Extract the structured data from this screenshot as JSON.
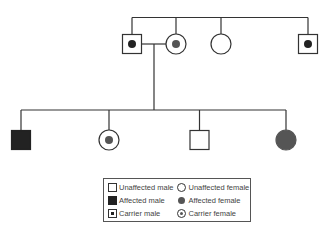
{
  "diagram": {
    "type": "pedigree",
    "colors": {
      "line": "#333333",
      "affected_male": "#222222",
      "affected_female": "#555555",
      "carrier_dot_male": "#222222",
      "carrier_dot_female": "#555555"
    },
    "generation_1": [
      {
        "id": "father",
        "sex": "male",
        "status": "carrier"
      },
      {
        "id": "mother",
        "sex": "female",
        "status": "carrier"
      },
      {
        "id": "sister",
        "sex": "female",
        "status": "unaffected"
      },
      {
        "id": "brother",
        "sex": "male",
        "status": "carrier"
      }
    ],
    "generation_2": [
      {
        "id": "child-1",
        "sex": "male",
        "status": "affected"
      },
      {
        "id": "child-2",
        "sex": "female",
        "status": "carrier"
      },
      {
        "id": "child-3",
        "sex": "male",
        "status": "unaffected"
      },
      {
        "id": "child-4",
        "sex": "female",
        "status": "affected"
      }
    ]
  },
  "legend": {
    "unaffected_male": "Unaffected male",
    "unaffected_female": "Unaffected female",
    "affected_male": "Affected male",
    "affected_female": "Affected female",
    "carrier_male": "Carrier male",
    "carrier_female": "Carrier female"
  }
}
